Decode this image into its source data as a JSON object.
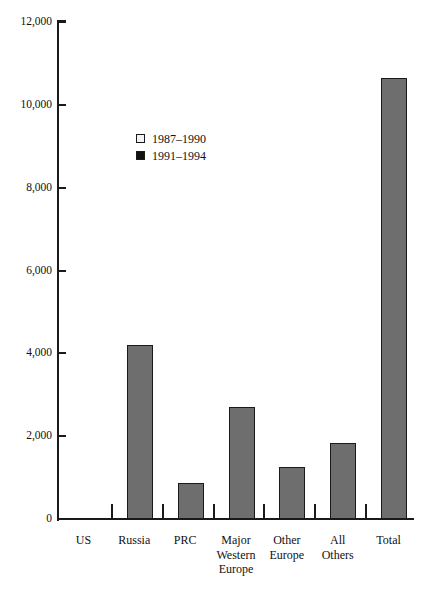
{
  "chart_data": {
    "type": "bar",
    "title": "",
    "xlabel": "",
    "ylabel": "",
    "ylim": [
      0,
      12000
    ],
    "grid": false,
    "legend_position": "inside-upper-left",
    "categories": [
      "US",
      "Russia",
      "PRC",
      "Major Western Europe",
      "Other Europe",
      "All Others",
      "Total"
    ],
    "category_lines": [
      [
        "US"
      ],
      [
        "Russia"
      ],
      [
        "PRC"
      ],
      [
        "Major",
        "Western",
        "Europe"
      ],
      [
        "Other",
        "Europe"
      ],
      [
        "All",
        "Others"
      ],
      [
        "Total"
      ]
    ],
    "series": [
      {
        "name": "1987–1990",
        "swatch_color": "#f2f2f2",
        "values": [
          0,
          0,
          0,
          0,
          0,
          0,
          0
        ]
      },
      {
        "name": "1991–1994",
        "swatch_color": "#111111",
        "values": [
          0,
          4200,
          870,
          2700,
          1250,
          1830,
          10650
        ]
      }
    ],
    "plotted_values": [
      0,
      4200,
      870,
      2700,
      1250,
      1830,
      10650
    ],
    "bar_fill_color": "#6e6e6e",
    "bar_border_color": "#1a1a1a",
    "axis_color": "#1a1a1a",
    "y_ticks": [
      {
        "value": 0,
        "label": "0"
      },
      {
        "value": 2000,
        "label": "2,000"
      },
      {
        "value": 4000,
        "label": "4,000"
      },
      {
        "value": 6000,
        "label": "6,000"
      },
      {
        "value": 8000,
        "label": "8,000"
      },
      {
        "value": 10000,
        "label": "10,000"
      },
      {
        "value": 12000,
        "label": "12,000"
      }
    ]
  },
  "legend": {
    "items": [
      {
        "label": "1987–1990"
      },
      {
        "label": "1991–1994"
      }
    ]
  }
}
